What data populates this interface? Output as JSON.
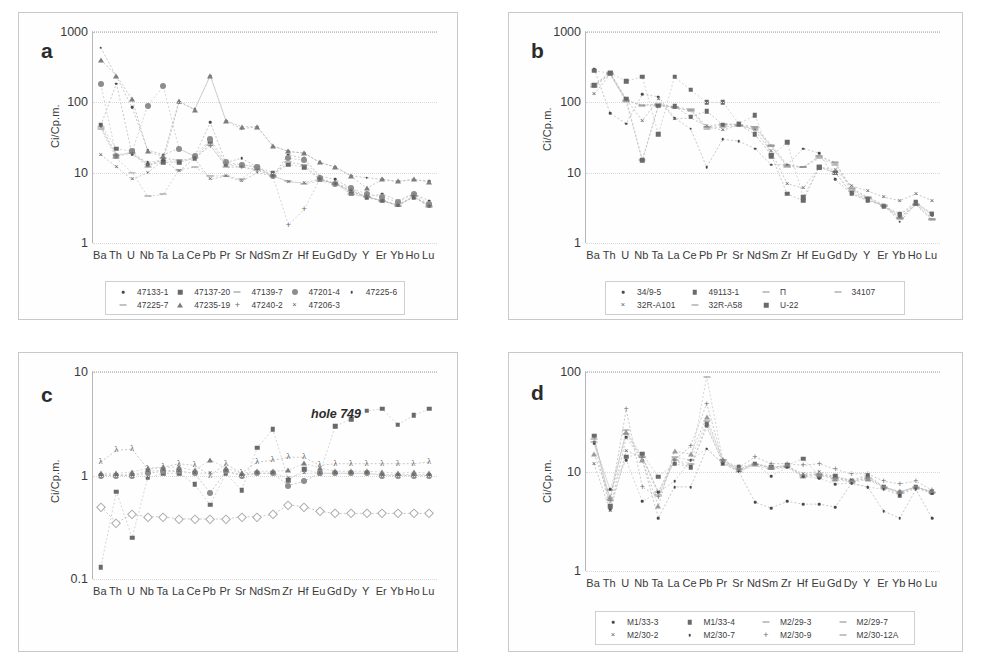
{
  "figure": {
    "elements": [
      "Ba",
      "Th",
      "U",
      "Nb",
      "Ta",
      "La",
      "Ce",
      "Pb",
      "Pr",
      "Sr",
      "Nd",
      "Sm",
      "Zr",
      "Hf",
      "Eu",
      "Gd",
      "Dy",
      "Y",
      "Er",
      "Yb",
      "Ho",
      "Lu"
    ],
    "ylabel": "Ci/Cp.m."
  },
  "chart_data": [
    {
      "panel": "a",
      "type": "line",
      "title": "",
      "xlabel": "",
      "ylabel": "Ci/Cp.m.",
      "yscale": "log",
      "ylim": [
        1,
        1000
      ],
      "yticks": [
        "1",
        "10",
        "100",
        "1000"
      ],
      "grid": true,
      "legend_position": "bottom",
      "categories": [
        "Ba",
        "Th",
        "U",
        "Nb",
        "Ta",
        "La",
        "Ce",
        "Pb",
        "Pr",
        "Sr",
        "Nd",
        "Sm",
        "Zr",
        "Hf",
        "Eu",
        "Gd",
        "Dy",
        "Y",
        "Er",
        "Yb",
        "Ho",
        "Lu"
      ],
      "series": [
        {
          "name": "47133-1",
          "marker": "dot",
          "values": [
            600,
            230,
            85,
            21,
            18,
            22,
            17,
            52,
            14,
            16,
            12,
            9,
            18,
            16,
            9,
            8,
            6,
            4.5,
            5,
            4,
            5,
            4
          ]
        },
        {
          "name": "47137-20",
          "marker": "square",
          "values": [
            48,
            22,
            20,
            13,
            14,
            14,
            16,
            28,
            13,
            13,
            12,
            10,
            13,
            12,
            8,
            7,
            5,
            4.5,
            4,
            3.5,
            4.5,
            3.5
          ]
        },
        {
          "name": "47139-7",
          "marker": "dash",
          "values": [
            45,
            18,
            19,
            12,
            16,
            15,
            16,
            25,
            12,
            12,
            11,
            9,
            14,
            13,
            8,
            7,
            5.5,
            4.5,
            4,
            3.4,
            4.6,
            3.4
          ]
        },
        {
          "name": "47201-4",
          "marker": "circle",
          "values": [
            180,
            17,
            20,
            90,
            170,
            22,
            17,
            30,
            14,
            13,
            12,
            9,
            16,
            15,
            8.5,
            7,
            6,
            5,
            4.5,
            3.8,
            5,
            3.6
          ]
        },
        {
          "name": "47225-6",
          "marker": "dot2",
          "values": [
            47,
            185,
            18,
            14,
            15,
            100,
            80,
            240,
            55,
            42,
            45,
            24,
            20,
            19,
            14,
            12,
            9,
            8.5,
            8,
            7.5,
            8,
            7.5
          ]
        },
        {
          "name": "47225-7",
          "marker": "dashline",
          "values": [
            42,
            16,
            10,
            4.6,
            4.9,
            11,
            12,
            9,
            9,
            8,
            12,
            9,
            7.5,
            7,
            7.5,
            7,
            5,
            4.5,
            4,
            3.4,
            4.6,
            3.3
          ]
        },
        {
          "name": "47235-19",
          "marker": "tri",
          "values": [
            400,
            240,
            110,
            20,
            17,
            105,
            78,
            240,
            55,
            45,
            45,
            24,
            20,
            19,
            14,
            12,
            9,
            6,
            8,
            7.5,
            8,
            7.4
          ]
        },
        {
          "name": "47240-2",
          "marker": "plus",
          "values": [
            46,
            17,
            19,
            13,
            15,
            14,
            16,
            24,
            13,
            12,
            11,
            9,
            1.8,
            3.0,
            8,
            7,
            5.5,
            4.6,
            4,
            3.5,
            4.6,
            3.4
          ]
        },
        {
          "name": "47206-3",
          "marker": "cross",
          "values": [
            18,
            12,
            8,
            10,
            15,
            10.5,
            16,
            8,
            9,
            7.5,
            10,
            9,
            7.4,
            7.2,
            8,
            7,
            5.5,
            4.4,
            4,
            3.4,
            4.5,
            3.3
          ]
        }
      ]
    },
    {
      "panel": "b",
      "type": "line",
      "title": "",
      "xlabel": "",
      "ylabel": "Ci/Cp.m.",
      "yscale": "log",
      "ylim": [
        1,
        1000
      ],
      "yticks": [
        "1",
        "10",
        "100",
        "1000"
      ],
      "grid": true,
      "legend_position": "bottom",
      "categories": [
        "Ba",
        "Th",
        "U",
        "Nb",
        "Ta",
        "La",
        "Ce",
        "Pb",
        "Pr",
        "Sr",
        "Nd",
        "Sm",
        "Zr",
        "Hf",
        "Eu",
        "Gd",
        "Dy",
        "Y",
        "Er",
        "Yb",
        "Ho",
        "Lu"
      ],
      "series": [
        {
          "name": "34/9-5",
          "marker": "dot",
          "values": [
            300,
            70,
            50,
            130,
            120,
            60,
            42,
            12,
            30,
            28,
            22,
            13,
            13,
            22,
            19,
            8,
            5,
            4,
            3.5,
            2.0,
            3.6,
            2.5
          ]
        },
        {
          "name": "49113-1",
          "marker": "square",
          "values": [
            280,
            260,
            200,
            230,
            35,
            230,
            150,
            100,
            100,
            50,
            65,
            17,
            27,
            4.5,
            12,
            10,
            5,
            4,
            3.4,
            2.6,
            3.8,
            2.6
          ]
        },
        {
          "name": "Π",
          "marker": "dashline",
          "values": [
            170,
            250,
            105,
            90,
            95,
            85,
            80,
            45,
            50,
            48,
            45,
            25,
            13,
            12,
            17,
            14,
            6,
            4.5,
            3.5,
            2.3,
            3.6,
            2.2
          ]
        },
        {
          "name": "34107",
          "marker": "line",
          "values": [
            165,
            255,
            100,
            15,
            90,
            85,
            75,
            42,
            45,
            46,
            42,
            24,
            12,
            12,
            16,
            13,
            5.5,
            4.3,
            3.4,
            2.2,
            3.5,
            2.1
          ]
        },
        {
          "name": "32R-A101",
          "marker": "cross",
          "values": [
            130,
            250,
            110,
            55,
            110,
            58,
            60,
            46,
            40,
            48,
            40,
            20,
            7,
            6,
            12,
            11,
            6.5,
            5.5,
            4.5,
            4.0,
            5.0,
            4.0
          ]
        },
        {
          "name": "32R-A58",
          "marker": "dashline2",
          "values": [
            180,
            260,
            108,
            92,
            92,
            82,
            78,
            44,
            48,
            47,
            44,
            24,
            12.5,
            12,
            17,
            13.5,
            5.8,
            4.4,
            3.4,
            2.3,
            3.5,
            2.2
          ]
        },
        {
          "name": "U-22",
          "marker": "square2",
          "values": [
            175,
            265,
            112,
            15,
            90,
            88,
            62,
            75,
            48,
            49,
            35,
            18,
            5,
            4,
            12,
            10,
            5.2,
            4.2,
            3.3,
            2.5,
            3.7,
            2.6
          ]
        }
      ]
    },
    {
      "panel": "c",
      "type": "line",
      "title": "",
      "xlabel": "",
      "ylabel": "Ci/Cp.m.",
      "yscale": "log",
      "ylim": [
        0.1,
        10
      ],
      "yticks": [
        "0.1",
        "1",
        "10"
      ],
      "grid": true,
      "annotation": "hole 749",
      "legend_position": "none",
      "categories": [
        "Ba",
        "Th",
        "U",
        "Nb",
        "Ta",
        "La",
        "Ce",
        "Pb",
        "Pr",
        "Sr",
        "Nd",
        "Sm",
        "Zr",
        "Hf",
        "Eu",
        "Gd",
        "Dy",
        "Y",
        "Er",
        "Yb",
        "Ho",
        "Lu"
      ],
      "series": [
        {
          "name": "series-1",
          "marker": "lam",
          "values": [
            1.35,
            1.75,
            1.8,
            1.15,
            1.2,
            1.3,
            1.25,
            1.0,
            1.3,
            1.05,
            1.35,
            1.4,
            1.5,
            1.5,
            1.25,
            1.3,
            1.3,
            1.3,
            1.3,
            1.3,
            1.3,
            1.35
          ]
        },
        {
          "name": "series-2",
          "marker": "square",
          "values": [
            0.13,
            0.7,
            0.25,
            0.95,
            1.05,
            1.05,
            0.82,
            0.52,
            1.05,
            0.72,
            1.85,
            2.8,
            0.9,
            1.15,
            1.05,
            3.0,
            3.5,
            4.2,
            4.4,
            3.1,
            3.8,
            4.4
          ]
        },
        {
          "name": "series-3",
          "marker": "circle",
          "values": [
            1.0,
            1.0,
            1.0,
            1.05,
            1.1,
            1.1,
            1.05,
            0.68,
            1.1,
            1.0,
            1.05,
            1.05,
            0.8,
            0.88,
            1.05,
            1.05,
            1.05,
            1.05,
            1.0,
            1.0,
            1.0,
            1.0
          ]
        },
        {
          "name": "series-4",
          "marker": "tri",
          "values": [
            1.05,
            1.05,
            1.08,
            1.18,
            1.2,
            1.2,
            1.12,
            1.42,
            1.18,
            1.05,
            1.1,
            1.1,
            1.12,
            1.32,
            1.18,
            1.1,
            1.1,
            1.1,
            1.08,
            1.05,
            1.08,
            1.05
          ]
        },
        {
          "name": "series-5",
          "marker": "diamond-o",
          "values": [
            0.5,
            0.35,
            0.42,
            0.4,
            0.4,
            0.38,
            0.38,
            0.38,
            0.38,
            0.4,
            0.4,
            0.42,
            0.52,
            0.5,
            0.45,
            0.43,
            0.43,
            0.43,
            0.43,
            0.43,
            0.43,
            0.43
          ]
        },
        {
          "name": "series-6",
          "marker": "cross",
          "values": [
            1.02,
            1.02,
            1.02,
            1.1,
            1.12,
            1.1,
            1.05,
            1.05,
            1.1,
            1.02,
            1.05,
            1.05,
            0.95,
            1.05,
            1.05,
            1.05,
            1.05,
            1.05,
            1.02,
            1.02,
            1.02,
            1.02
          ]
        }
      ]
    },
    {
      "panel": "d",
      "type": "line",
      "title": "",
      "xlabel": "",
      "ylabel": "Ci/Cp.m.",
      "yscale": "log",
      "ylim": [
        1,
        100
      ],
      "yticks": [
        "1",
        "10",
        "100"
      ],
      "grid": true,
      "legend_position": "bottom",
      "categories": [
        "Ba",
        "Th",
        "U",
        "Nb",
        "Ta",
        "La",
        "Ce",
        "Pb",
        "Pr",
        "Sr",
        "Nd",
        "Sm",
        "Zr",
        "Hf",
        "Eu",
        "Gd",
        "Dy",
        "Y",
        "Er",
        "Yb",
        "Ho",
        "Lu"
      ],
      "series": [
        {
          "name": "M1/33-3",
          "marker": "dot",
          "values": [
            20,
            4.2,
            22,
            13,
            3.4,
            7.0,
            7.0,
            17,
            12,
            10,
            4.9,
            4.3,
            5.0,
            4.7,
            4.7,
            4.4,
            7.6,
            7.0,
            4.0,
            3.4,
            6.6,
            3.4
          ]
        },
        {
          "name": "M1/33-4",
          "marker": "square",
          "values": [
            23,
            4.5,
            14,
            15,
            8.9,
            12,
            11,
            30,
            12,
            11,
            12,
            11,
            11.5,
            13.5,
            9.0,
            9.0,
            8.0,
            9.0,
            7.0,
            5.8,
            7.0,
            6.2
          ]
        },
        {
          "name": "M2/29-3",
          "marker": "tri-o",
          "values": [
            15,
            5.5,
            25,
            13,
            4.5,
            16,
            15,
            35,
            13,
            10.5,
            12,
            11,
            11.5,
            9.0,
            9.5,
            8.5,
            8.0,
            8.5,
            7.0,
            6.3,
            7.0,
            6.3
          ]
        },
        {
          "name": "M2/29-7",
          "marker": "dashline",
          "values": [
            20,
            6.5,
            24,
            14,
            6.2,
            14,
            13,
            32,
            13,
            10,
            11.5,
            10.5,
            11,
            8.8,
            9.2,
            8.3,
            7.8,
            8.3,
            6.9,
            6.1,
            6.9,
            6.1
          ]
        },
        {
          "name": "M2/30-2",
          "marker": "cross",
          "values": [
            12,
            4.0,
            16,
            14,
            6.2,
            13,
            11,
            28,
            12.5,
            10.2,
            11.8,
            10.8,
            11.2,
            9.5,
            10,
            8.8,
            8.2,
            9.2,
            7.0,
            6.2,
            7.0,
            6.2
          ]
        },
        {
          "name": "M2/30-7",
          "marker": "dot2",
          "values": [
            19,
            6.6,
            13,
            5.0,
            6.2,
            8.0,
            13,
            17,
            12,
            10,
            12,
            9.0,
            11,
            9.0,
            8.5,
            7.5,
            7.6,
            7.0,
            6.6,
            5.8,
            6.8,
            6.0
          ]
        },
        {
          "name": "M2/30-9",
          "marker": "plus",
          "values": [
            22,
            5.0,
            42,
            7.0,
            5.5,
            13,
            18,
            48,
            13,
            11,
            14,
            12,
            12,
            11.5,
            12,
            10.5,
            9.5,
            9.5,
            8.0,
            7.5,
            8.0,
            6.5
          ]
        },
        {
          "name": "M2/30-12A",
          "marker": "dash",
          "values": [
            21,
            5.2,
            26,
            14,
            5.8,
            13,
            12,
            90,
            13,
            10.5,
            12,
            10.8,
            11.3,
            9.2,
            9.5,
            8.6,
            8.0,
            8.6,
            7.0,
            6.2,
            7.0,
            6.2
          ]
        }
      ]
    }
  ],
  "panels": {
    "a": {
      "letter": "a",
      "legend": [
        {
          "label": "47133-1",
          "marker": "dot"
        },
        {
          "label": "47137-20",
          "marker": "square"
        },
        {
          "label": "47139-7",
          "marker": "dash"
        },
        {
          "label": "47201-4",
          "marker": "circle"
        },
        {
          "label": "47225-6",
          "marker": "dot"
        },
        {
          "label": "47225-7",
          "marker": "dash"
        },
        {
          "label": "47235-19",
          "marker": "tri"
        },
        {
          "label": "47240-2",
          "marker": "plus"
        },
        {
          "label": "47206-3",
          "marker": "cross"
        }
      ]
    },
    "b": {
      "letter": "b",
      "legend": [
        {
          "label": "34/9-5",
          "marker": "dot"
        },
        {
          "label": "49113-1",
          "marker": "square"
        },
        {
          "label": "П",
          "marker": "dash"
        },
        {
          "label": "34107",
          "marker": "dash"
        },
        {
          "label": "32R-A101",
          "marker": "cross"
        },
        {
          "label": "32R-A58",
          "marker": "dash"
        },
        {
          "label": "U-22",
          "marker": "square"
        }
      ]
    },
    "c": {
      "letter": "c",
      "annotation": "hole 749",
      "legend": []
    },
    "d": {
      "letter": "d",
      "legend": [
        {
          "label": "M1/33-3",
          "marker": "dot"
        },
        {
          "label": "M1/33-4",
          "marker": "square"
        },
        {
          "label": "M2/29-3",
          "marker": "dash"
        },
        {
          "label": "M2/29-7",
          "marker": "dash"
        },
        {
          "label": "M2/30-2",
          "marker": "cross"
        },
        {
          "label": "M2/30-7",
          "marker": "dot"
        },
        {
          "label": "M2/30-9",
          "marker": "plus"
        },
        {
          "label": "M2/30-12A",
          "marker": "dash"
        }
      ]
    }
  },
  "colors": {
    "frame": "#c9c9c9",
    "axis": "#b7b7b7",
    "grid": "#d9d9d9",
    "text": "#3a3a3a",
    "marker_dark": "#4a4a4a",
    "marker_mid": "#7d7d7d",
    "marker_light": "#a9a9a9"
  }
}
